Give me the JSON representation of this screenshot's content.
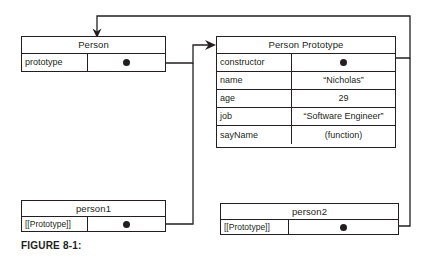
{
  "figure": {
    "caption": "FIGURE 8-1:"
  },
  "boxes": {
    "person": {
      "title": "Person",
      "rows": [
        {
          "key": "prototype",
          "value": "",
          "pointer": "pointer-dot"
        }
      ]
    },
    "person_prototype": {
      "title": "Person Prototype",
      "rows": [
        {
          "key": "constructor",
          "value": "",
          "pointer": "pointer-dot"
        },
        {
          "key": "name",
          "value": "“Nicholas”",
          "pointer": ""
        },
        {
          "key": "age",
          "value": "29",
          "pointer": ""
        },
        {
          "key": "job",
          "value": "“Software Engineer”",
          "pointer": ""
        },
        {
          "key": "sayName",
          "value": "(function)",
          "pointer": ""
        }
      ]
    },
    "person1": {
      "title": "person1",
      "rows": [
        {
          "key": "[[Prototype]]",
          "value": "",
          "pointer": "pointer-dot"
        }
      ]
    },
    "person2": {
      "title": "person2",
      "rows": [
        {
          "key": "[[Prototype]]",
          "value": "",
          "pointer": "pointer-dot"
        }
      ]
    }
  },
  "connectors": [
    {
      "name": "person-prototype-to-person-prototype-object",
      "from": "Person.prototype",
      "to": "Person Prototype",
      "arrowhead": "right"
    },
    {
      "name": "person-prototype-constructor-to-person",
      "from": "Person Prototype.constructor",
      "to": "Person",
      "arrowhead": "down"
    },
    {
      "name": "person1-prototype-to-person-prototype-object",
      "from": "person1.[[Prototype]]",
      "to": "Person Prototype",
      "arrowhead": "none"
    },
    {
      "name": "person2-prototype-to-person-prototype-object",
      "from": "person2.[[Prototype]]",
      "to": "Person Prototype",
      "arrowhead": "none"
    }
  ],
  "colors": {
    "stroke": "#231f20",
    "background": "#ffffff"
  }
}
